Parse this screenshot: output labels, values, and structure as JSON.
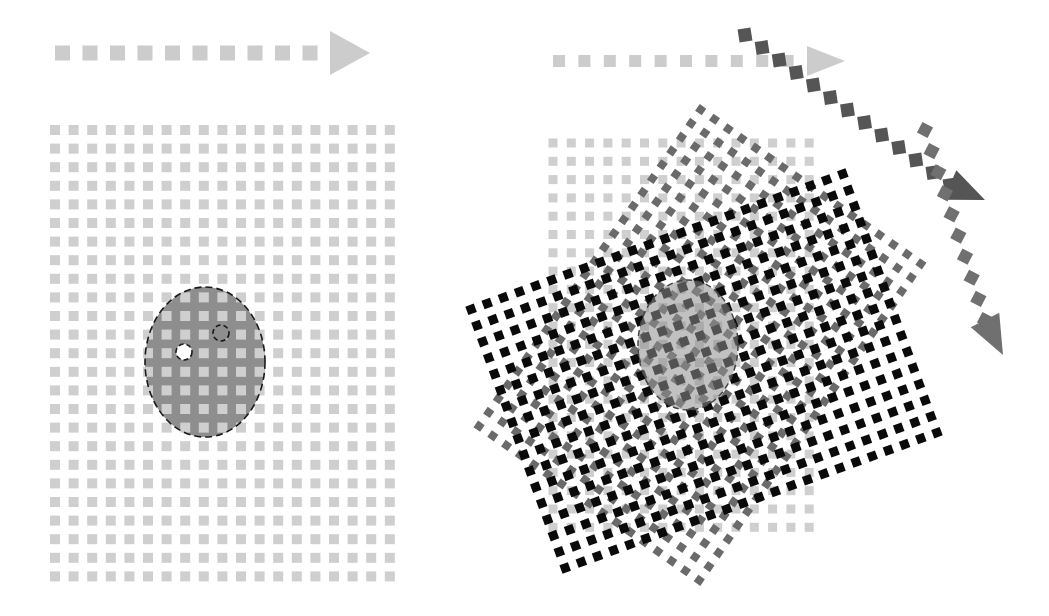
{
  "diagram": {
    "canvas": {
      "width": 1049,
      "height": 616,
      "background": "#ffffff"
    },
    "colors": {
      "light_grid": "#cfcfcf",
      "oval_fill": "#8e8e8e",
      "oval_stroke": "#1a1a1a",
      "mid_grid": "#6a6a6a",
      "dark_grid": "#0a0a0a",
      "arrow_light": "#cccccc",
      "arrow_dark": "#555555",
      "arrow_mid": "#707070"
    },
    "left_panel": {
      "arrow": {
        "x0": 55,
        "x1": 370,
        "y": 53,
        "dot": 15,
        "count": 10,
        "head_len": 40,
        "head_half": 22
      },
      "grid": {
        "x0": 55,
        "y0": 130,
        "cols": 19,
        "rows": 25,
        "pitch": 18.6,
        "dot": 10
      },
      "oval": {
        "cx": 205,
        "cy": 362,
        "rx": 60,
        "ry": 75
      },
      "holes": [
        {
          "cx": 184,
          "cy": 352,
          "r": 8,
          "filled": true
        },
        {
          "cx": 221,
          "cy": 333,
          "r": 8,
          "filled": false
        }
      ]
    },
    "right_panel": {
      "arrow": {
        "x0": 553,
        "x1": 845,
        "y": 61,
        "dot": 12,
        "count": 10,
        "head_len": 38,
        "head_half": 15
      },
      "grid_light": {
        "x0": 553,
        "y0": 143,
        "cols": 15,
        "rows": 22,
        "pitch": 18.3,
        "dot": 9
      },
      "grid_mid": {
        "cx": 700,
        "cy": 345,
        "cols": 17,
        "rows": 24,
        "pitch": 16.8,
        "dot": 8,
        "angle": 35
      },
      "grid_dark": {
        "cx": 704,
        "cy": 371,
        "cols": 24,
        "rows": 17,
        "pitch": 17.2,
        "dot": 9,
        "angle": -20
      },
      "oval": {
        "cx": 688,
        "cy": 345,
        "rx": 50,
        "ry": 65
      },
      "arrow_diag": {
        "points": [
          [
            745,
            35
          ],
          [
            950,
            185
          ]
        ],
        "dot": 13,
        "count": 13,
        "head_tip": [
          985,
          200
        ]
      },
      "arrow_down": {
        "points": [
          [
            925,
            130
          ],
          [
            985,
            320
          ]
        ],
        "dot": 12,
        "count": 10,
        "head_tip": [
          1003,
          355
        ]
      }
    }
  }
}
